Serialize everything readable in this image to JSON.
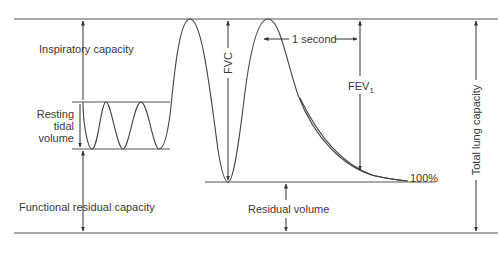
{
  "diagram": {
    "type": "spirogram",
    "colors": {
      "line": "#555555",
      "text": "#3a3a3a",
      "background": "#ffffff"
    },
    "labels": {
      "inspiratory_capacity": "Inspiratory capacity",
      "resting_tidal_volume_l1": "Resting",
      "resting_tidal_volume_l2": "tidal",
      "resting_tidal_volume_l3": "volume",
      "functional_residual_capacity": "Functional residual capacity",
      "fvc": "FVC",
      "one_second": "1 second",
      "fev1_main": "FEV",
      "fev1_sub": "1",
      "residual_volume": "Residual volume",
      "percent_100": "100%",
      "total_lung_capacity": "Total lung capacity"
    }
  }
}
